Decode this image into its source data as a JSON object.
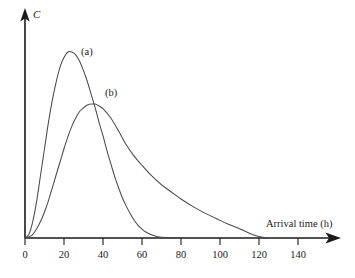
{
  "chart_data": {
    "type": "line",
    "title": "",
    "subtitle": "",
    "xlabel": "Arrival time (h)",
    "ylabel": "C",
    "xlim": [
      0,
      150
    ],
    "ylim": [
      0,
      1.05
    ],
    "grid": false,
    "legend_position": "inline-annotation",
    "xticks": [
      0,
      20,
      40,
      60,
      80,
      100,
      120,
      140
    ],
    "xtick_labels": [
      "0",
      "20",
      "40",
      "60",
      "80",
      "100",
      "120",
      "140"
    ],
    "yticks": [],
    "ytick_labels": [],
    "annotations": [
      {
        "text": "(a)",
        "x": 31,
        "y": 0.95
      },
      {
        "text": "(b)",
        "x": 44,
        "y": 0.72
      }
    ],
    "series": [
      {
        "name": "(a)",
        "label": "(a)",
        "color": "#4a4a4a",
        "peak_x": 24,
        "peak_y": 1.0,
        "x": [
          0,
          2,
          4,
          6,
          8,
          10,
          12,
          14,
          16,
          18,
          20,
          22,
          24,
          26,
          28,
          30,
          32,
          34,
          36,
          38,
          40,
          42,
          44,
          46,
          48,
          50,
          52,
          54,
          56,
          58,
          60,
          62,
          64,
          66,
          68,
          70,
          75,
          80
        ],
        "y": [
          0.0,
          0.02,
          0.09,
          0.2,
          0.34,
          0.48,
          0.62,
          0.74,
          0.84,
          0.92,
          0.97,
          1.0,
          1.0,
          0.985,
          0.95,
          0.9,
          0.84,
          0.77,
          0.7,
          0.62,
          0.55,
          0.47,
          0.4,
          0.33,
          0.27,
          0.215,
          0.17,
          0.13,
          0.095,
          0.068,
          0.048,
          0.032,
          0.021,
          0.013,
          0.007,
          0.004,
          0.001,
          0.0
        ]
      },
      {
        "name": "(b)",
        "label": "(b)",
        "color": "#4a4a4a",
        "peak_x": 36,
        "peak_y": 0.72,
        "x": [
          0,
          2,
          4,
          6,
          8,
          10,
          12,
          14,
          16,
          18,
          20,
          22,
          24,
          26,
          28,
          30,
          32,
          34,
          36,
          38,
          40,
          44,
          48,
          52,
          56,
          60,
          64,
          68,
          72,
          76,
          80,
          86,
          92,
          98,
          104,
          110,
          116,
          120,
          124
        ],
        "y": [
          0.0,
          0.005,
          0.02,
          0.05,
          0.09,
          0.14,
          0.2,
          0.27,
          0.34,
          0.41,
          0.48,
          0.545,
          0.6,
          0.645,
          0.68,
          0.7,
          0.715,
          0.72,
          0.72,
          0.71,
          0.695,
          0.645,
          0.575,
          0.5,
          0.44,
          0.39,
          0.345,
          0.305,
          0.27,
          0.24,
          0.21,
          0.17,
          0.135,
          0.105,
          0.075,
          0.05,
          0.022,
          0.008,
          0.0
        ]
      }
    ]
  },
  "axes": {
    "y_label": "C",
    "x_label": "Arrival time (h)"
  }
}
